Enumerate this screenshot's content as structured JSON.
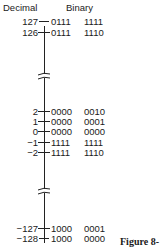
{
  "headers": {
    "decimal": "Decimal",
    "binary": "Binary"
  },
  "rows": [
    {
      "decimal": "127",
      "high": "0111",
      "low": "1111"
    },
    {
      "decimal": "126",
      "high": "0111",
      "low": "1110"
    },
    {
      "decimal": "2",
      "high": "0000",
      "low": "0010"
    },
    {
      "decimal": "1",
      "high": "0000",
      "low": "0001"
    },
    {
      "decimal": "0",
      "high": "0000",
      "low": "0000"
    },
    {
      "decimal": "−1",
      "high": "1111",
      "low": "1111"
    },
    {
      "decimal": "−2",
      "high": "1111",
      "low": "1110"
    },
    {
      "decimal": "−127",
      "high": "1000",
      "low": "0001"
    },
    {
      "decimal": "−128",
      "high": "1000",
      "low": "0000"
    }
  ],
  "breaks": [
    "axis-break-upper",
    "axis-break-lower"
  ],
  "caption": "Figure 8-"
}
